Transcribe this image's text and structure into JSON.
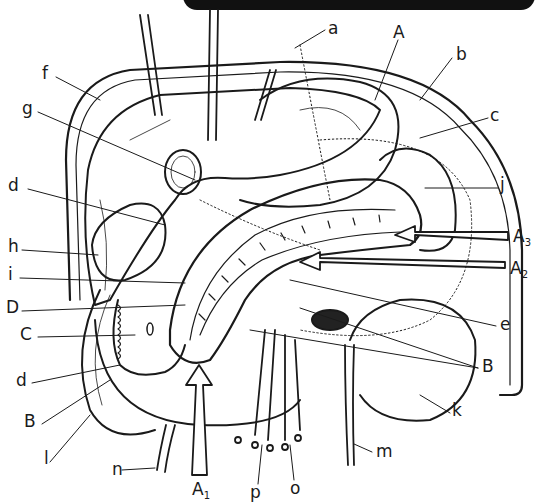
{
  "figure": {
    "title_banner_text": "",
    "line_color": "#1a1a1a",
    "fill_color": "#ffffff",
    "dark_fill": "#222222"
  },
  "labels": {
    "a": "a",
    "b": "b",
    "c": "c",
    "d_upper": "d",
    "d_lower": "d",
    "e": "e",
    "f": "f",
    "g": "g",
    "h": "h",
    "i": "i",
    "j": "j",
    "k": "k",
    "l": "l",
    "m": "m",
    "n": "n",
    "o": "o",
    "p": "p",
    "A": "A",
    "A1": {
      "main": "A",
      "sub": "1"
    },
    "A2": {
      "main": "A",
      "sub": "2"
    },
    "A3": {
      "main": "A",
      "sub": "3"
    },
    "B_left": "B",
    "B_right": "B",
    "C": "C",
    "D": "D"
  }
}
